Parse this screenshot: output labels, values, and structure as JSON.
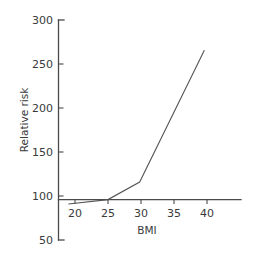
{
  "chart_data": {
    "type": "line",
    "title": "",
    "subtitle": "",
    "xlabel": "BMI",
    "ylabel": "Relative risk",
    "xlim": [
      17.5,
      42.5
    ],
    "ylim": [
      50,
      300
    ],
    "xticks": [
      20,
      25,
      30,
      35,
      40
    ],
    "xtick_labels": [
      "20",
      "25",
      "30",
      "35",
      "40"
    ],
    "yticks": [
      50,
      100,
      150,
      200,
      250,
      300
    ],
    "ytick_labels": [
      "50",
      "100",
      "150",
      "200",
      "250",
      "300"
    ],
    "grid": false,
    "legend": null,
    "legend_position": "none",
    "baseline_y": 100,
    "annotations": [],
    "series": [
      {
        "name": "Relative risk vs BMI",
        "color": "#555555",
        "x": [
          19.0,
          25.0,
          29.8,
          39.6
        ],
        "values": [
          95,
          100,
          120,
          270
        ]
      }
    ]
  },
  "axes": {
    "y_axis_title": "Relative risk",
    "x_axis_title": "BMI"
  },
  "y_tick_text": {
    "t300": "300",
    "t250": "250",
    "t200": "200",
    "t150": "150",
    "t100": "100",
    "t50": "50"
  },
  "x_tick_text": {
    "t20": "20",
    "t25": "25",
    "t30": "30",
    "t35": "35",
    "t40": "40"
  },
  "colors": {
    "background": "#ffffff",
    "axis": "#4a4a4a",
    "data_line": "#555555",
    "text": "#3a3a3a"
  }
}
